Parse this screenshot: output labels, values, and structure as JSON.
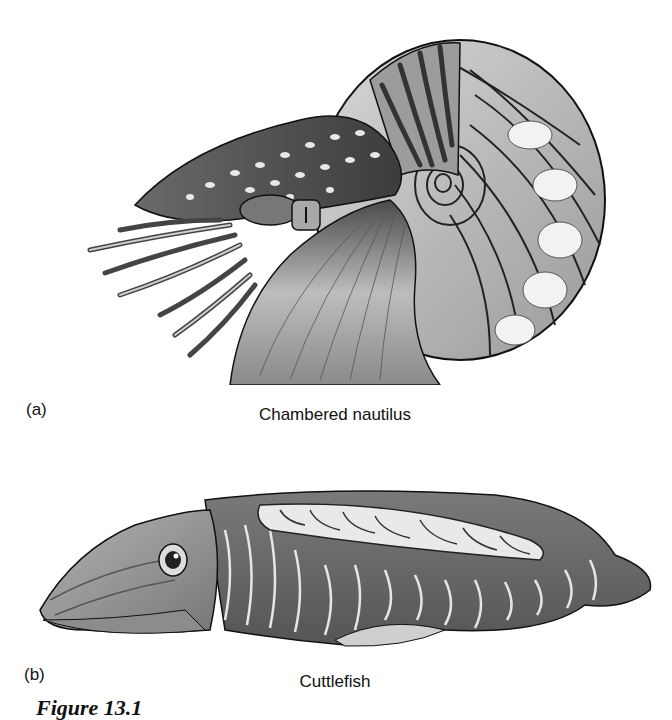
{
  "figure": {
    "panels": [
      {
        "label": "(a)",
        "caption": "Chambered nautilus",
        "illustration": "nautilus-illustration"
      },
      {
        "label": "(b)",
        "caption": "Cuttlefish",
        "illustration": "cuttlefish-illustration"
      }
    ],
    "figure_caption_partial": "Figure 13.1"
  }
}
